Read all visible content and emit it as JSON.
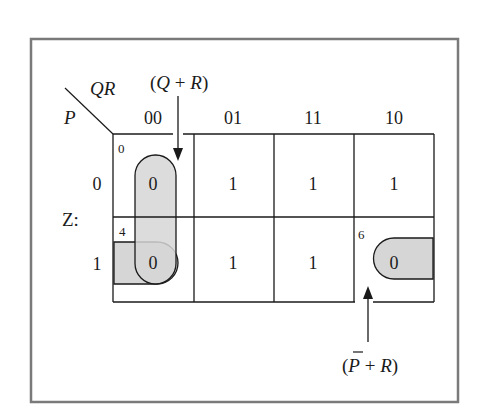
{
  "diagram": {
    "type": "karnaugh-map",
    "output_label": "Z:",
    "row_var": "P",
    "col_vars": "QR",
    "column_headers": [
      "00",
      "01",
      "11",
      "10"
    ],
    "row_headers": [
      "0",
      "1"
    ],
    "cells": [
      [
        {
          "value": "0",
          "index": "0"
        },
        {
          "value": "1",
          "index": ""
        },
        {
          "value": "1",
          "index": ""
        },
        {
          "value": "1",
          "index": ""
        }
      ],
      [
        {
          "value": "0",
          "index": "4"
        },
        {
          "value": "1",
          "index": ""
        },
        {
          "value": "1",
          "index": ""
        },
        {
          "value": "0",
          "index": "6"
        }
      ]
    ],
    "groups": [
      {
        "label": "(Q + R)",
        "label_q": "Q",
        "label_r": "R",
        "cells": [
          "0",
          "4"
        ]
      },
      {
        "label": "(P̄ + R)",
        "label_p": "P",
        "label_r": "R",
        "cells": [
          "4",
          "6"
        ]
      }
    ],
    "colors": {
      "frame": "#7a7a7a",
      "grid": "#1a1a1a",
      "loop_fill": "#d6d6d6",
      "loop_stroke": "#1a1a1a",
      "text": "#1a1a1a"
    }
  }
}
